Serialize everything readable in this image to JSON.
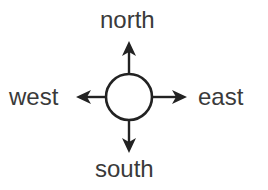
{
  "diagram": {
    "type": "compass-directions",
    "labels": {
      "north": "north",
      "west": "west",
      "east": "east",
      "south": "south"
    },
    "center_icon": "circle",
    "arrows": [
      "north-arrow",
      "south-arrow",
      "west-arrow",
      "east-arrow"
    ],
    "colors": {
      "text": "#3a3a3a",
      "stroke": "#222222",
      "background": "#ffffff"
    }
  }
}
